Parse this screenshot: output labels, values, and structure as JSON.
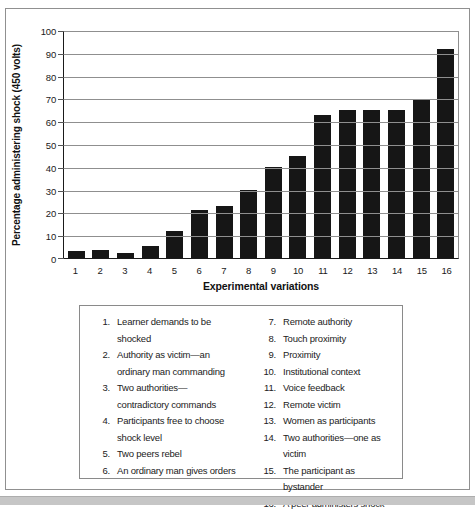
{
  "page": {
    "background": "#ffffff",
    "frame_border_color": "#909090",
    "bottom_band_color": "#c6c6c6"
  },
  "chart_data": {
    "type": "bar",
    "title": "",
    "xlabel": "Experimental variations",
    "ylabel": "Percentage administering shock (450 volts)",
    "categories": [
      "1",
      "2",
      "3",
      "4",
      "5",
      "6",
      "7",
      "8",
      "9",
      "10",
      "11",
      "12",
      "13",
      "14",
      "15",
      "16"
    ],
    "values": [
      3,
      3.5,
      2,
      5.5,
      12,
      21,
      23,
      30,
      40,
      45,
      63,
      65,
      65,
      65,
      70,
      92
    ],
    "ylim": [
      0,
      100
    ],
    "yticks": [
      0,
      10,
      20,
      30,
      40,
      50,
      60,
      70,
      80,
      90,
      100
    ],
    "grid": "horizontal",
    "legend_position": "below-in-box",
    "bar_color": "#161616",
    "axis_color": "#1a1a1a",
    "grid_color": "#8f8f8f"
  },
  "legend": {
    "columns": [
      {
        "items": [
          {
            "num": "1.",
            "label": "Learner demands to be\nshocked"
          },
          {
            "num": "2.",
            "label": "Authority as victim—an\nordinary man commanding"
          },
          {
            "num": "3.",
            "label": "Two authorities—\ncontradictory commands"
          },
          {
            "num": "4.",
            "label": "Participants free to choose\nshock level"
          },
          {
            "num": "5.",
            "label": "Two peers rebel"
          },
          {
            "num": "6.",
            "label": "An ordinary man gives orders"
          }
        ]
      },
      {
        "items": [
          {
            "num": "7.",
            "label": "Remote authority"
          },
          {
            "num": "8.",
            "label": "Touch proximity"
          },
          {
            "num": "9.",
            "label": "Proximity"
          },
          {
            "num": "10.",
            "label": "Institutional context"
          },
          {
            "num": "11.",
            "label": "Voice feedback"
          },
          {
            "num": "12.",
            "label": "Remote victim"
          },
          {
            "num": "13.",
            "label": "Women as participants"
          },
          {
            "num": "14.",
            "label": "Two authorities—one as victim"
          },
          {
            "num": "15.",
            "label": "The participant as bystander"
          },
          {
            "num": "16.",
            "label": "A peer administers shock"
          }
        ]
      }
    ]
  }
}
